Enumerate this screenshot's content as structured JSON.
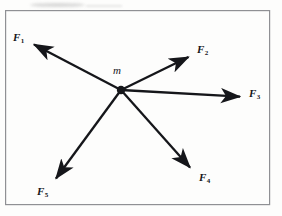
{
  "figure": {
    "type": "force-diagram",
    "caption_present": false,
    "background_color": "#fdfdfc",
    "ink_color": "#15161a",
    "frame": {
      "name": "diagram-border",
      "x": 5,
      "y": 10,
      "width": 265,
      "height": 195,
      "stroke_color": "#8f9094",
      "stroke_width": 1.2
    },
    "origin": {
      "name": "point-mass",
      "label": "m",
      "x": 121,
      "y": 90,
      "radius": 4.2,
      "label_x": 113,
      "label_y": 65
    },
    "vectors": [
      {
        "id": "F1",
        "label": "F",
        "subscript": "1",
        "x1": 121,
        "y1": 90,
        "x2": 31,
        "y2": 43,
        "label_x": 13,
        "label_y": 32,
        "direction_deg": 152
      },
      {
        "id": "F2",
        "label": "F",
        "subscript": "2",
        "x1": 121,
        "y1": 90,
        "x2": 192,
        "y2": 55,
        "label_x": 197,
        "label_y": 44,
        "direction_deg": 26
      },
      {
        "id": "F3",
        "label": "F",
        "subscript": "3",
        "x1": 121,
        "y1": 90,
        "x2": 244,
        "y2": 97,
        "label_x": 249,
        "label_y": 88,
        "direction_deg": -3
      },
      {
        "id": "F4",
        "label": "F",
        "subscript": "4",
        "x1": 121,
        "y1": 90,
        "x2": 194,
        "y2": 172,
        "label_x": 199,
        "label_y": 172,
        "direction_deg": -48
      },
      {
        "id": "F5",
        "label": "F",
        "subscript": "5",
        "x1": 121,
        "y1": 90,
        "x2": 52,
        "y2": 184,
        "label_x": 37,
        "label_y": 186,
        "direction_deg": -126
      }
    ],
    "artifacts": [
      {
        "name": "scan-smudge-top",
        "x": 30,
        "y": 3,
        "width": 55,
        "height": 4
      },
      {
        "name": "scan-smudge-top-right",
        "x": 86,
        "y": 5,
        "width": 36,
        "height": 1.5
      }
    ]
  }
}
